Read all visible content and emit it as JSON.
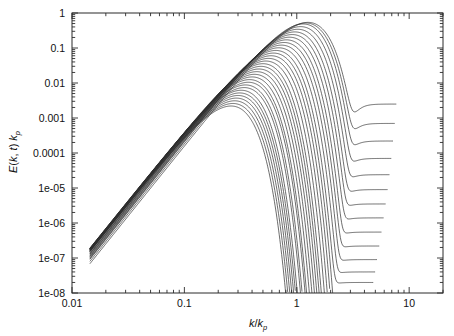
{
  "figure": {
    "background_color": "#ffffff",
    "frame_color": "#2b2b2b",
    "line_color": "#2e2e2e"
  },
  "axes": {
    "x": {
      "label_main": "k",
      "label_slash": "/",
      "label_den": "k",
      "label_den_sub": "p",
      "label_full": "k/k_p",
      "scale": "log",
      "min": 0.01,
      "max": 20,
      "tick_labels": [
        "0.01",
        "0.1",
        "1",
        "10"
      ],
      "tick_values": [
        0.01,
        0.1,
        1,
        10
      ]
    },
    "y": {
      "label_fn": "E",
      "label_args": "(k, t)",
      "label_factor": "k",
      "label_factor_sub": "p",
      "label_full": "E(k, t) k_p",
      "scale": "log",
      "min": 1e-08,
      "max": 1,
      "tick_labels": [
        "1",
        "0.1",
        "0.01",
        "0.001",
        "0.0001",
        "1e-05",
        "1e-06",
        "1e-07",
        "1e-08"
      ],
      "tick_values": [
        1,
        0.1,
        0.01,
        0.001,
        0.0001,
        1e-05,
        1e-06,
        1e-07,
        1e-08
      ]
    }
  },
  "chart_data": {
    "type": "line",
    "title": "",
    "xlabel": "k/k_p",
    "ylabel": "E(k, t) k_p",
    "xscale": "log",
    "yscale": "log",
    "xlim": [
      0.01,
      20
    ],
    "ylim": [
      1e-08,
      1
    ],
    "grid": false,
    "legend": "none",
    "n_curves": 34,
    "low_k_slope": 4,
    "series": [
      {
        "name": "t01",
        "peak_x": 0.26,
        "peak_y": 0.0022,
        "cutoff_x": 2.1,
        "tail_floor": null
      },
      {
        "name": "t02",
        "peak_x": 0.27,
        "peak_y": 0.0026,
        "cutoff_x": 2.2,
        "tail_floor": null
      },
      {
        "name": "t03",
        "peak_x": 0.28,
        "peak_y": 0.0031,
        "cutoff_x": 2.25,
        "tail_floor": null
      },
      {
        "name": "t04",
        "peak_x": 0.29,
        "peak_y": 0.0037,
        "cutoff_x": 2.3,
        "tail_floor": null
      },
      {
        "name": "t05",
        "peak_x": 0.3,
        "peak_y": 0.0044,
        "cutoff_x": 2.35,
        "tail_floor": null
      },
      {
        "name": "t06",
        "peak_x": 0.31,
        "peak_y": 0.0052,
        "cutoff_x": 2.4,
        "tail_floor": null
      },
      {
        "name": "t07",
        "peak_x": 0.32,
        "peak_y": 0.0062,
        "cutoff_x": 2.45,
        "tail_floor": null
      },
      {
        "name": "t08",
        "peak_x": 0.34,
        "peak_y": 0.0074,
        "cutoff_x": 2.5,
        "tail_floor": null
      },
      {
        "name": "t09",
        "peak_x": 0.35,
        "peak_y": 0.0088,
        "cutoff_x": 2.55,
        "tail_floor": null
      },
      {
        "name": "t10",
        "peak_x": 0.37,
        "peak_y": 0.0105,
        "cutoff_x": 2.6,
        "tail_floor": null
      },
      {
        "name": "t11",
        "peak_x": 0.38,
        "peak_y": 0.0125,
        "cutoff_x": 2.65,
        "tail_floor": null
      },
      {
        "name": "t12",
        "peak_x": 0.4,
        "peak_y": 0.0149,
        "cutoff_x": 2.72,
        "tail_floor": null
      },
      {
        "name": "t13",
        "peak_x": 0.42,
        "peak_y": 0.0177,
        "cutoff_x": 2.8,
        "tail_floor": null
      },
      {
        "name": "t14",
        "peak_x": 0.44,
        "peak_y": 0.0211,
        "cutoff_x": 2.88,
        "tail_floor": null
      },
      {
        "name": "t15",
        "peak_x": 0.46,
        "peak_y": 0.0251,
        "cutoff_x": 2.96,
        "tail_floor": null
      },
      {
        "name": "t16",
        "peak_x": 0.48,
        "peak_y": 0.0299,
        "cutoff_x": 3.05,
        "tail_floor": null
      },
      {
        "name": "t17",
        "peak_x": 0.5,
        "peak_y": 0.0356,
        "cutoff_x": 3.15,
        "tail_floor": null
      },
      {
        "name": "t18",
        "peak_x": 0.53,
        "peak_y": 0.0424,
        "cutoff_x": 3.25,
        "tail_floor": null
      },
      {
        "name": "t19",
        "peak_x": 0.56,
        "peak_y": 0.0505,
        "cutoff_x": 3.35,
        "tail_floor": null
      },
      {
        "name": "t20",
        "peak_x": 0.59,
        "peak_y": 0.0601,
        "cutoff_x": 3.5,
        "tail_floor": null
      },
      {
        "name": "t21",
        "peak_x": 0.62,
        "peak_y": 0.0716,
        "cutoff_x": 3.65,
        "tail_floor": null
      },
      {
        "name": "t22",
        "peak_x": 0.65,
        "peak_y": 0.0852,
        "cutoff_x": 3.8,
        "tail_floor": 2e-08
      },
      {
        "name": "t23",
        "peak_x": 0.69,
        "peak_y": 0.1014,
        "cutoff_x": 3.95,
        "tail_floor": 4e-08
      },
      {
        "name": "t24",
        "peak_x": 0.73,
        "peak_y": 0.1207,
        "cutoff_x": 4.1,
        "tail_floor": 9e-08
      },
      {
        "name": "t25",
        "peak_x": 0.77,
        "peak_y": 0.1437,
        "cutoff_x": 4.3,
        "tail_floor": 2.2e-07
      },
      {
        "name": "t26",
        "peak_x": 0.81,
        "peak_y": 0.171,
        "cutoff_x": 4.5,
        "tail_floor": 5.5e-07
      },
      {
        "name": "t27",
        "peak_x": 0.86,
        "peak_y": 0.2035,
        "cutoff_x": 4.7,
        "tail_floor": 1.4e-06
      },
      {
        "name": "t28",
        "peak_x": 0.91,
        "peak_y": 0.2422,
        "cutoff_x": 4.9,
        "tail_floor": 3.5e-06
      },
      {
        "name": "t29",
        "peak_x": 0.96,
        "peak_y": 0.2882,
        "cutoff_x": 5.1,
        "tail_floor": 9e-06
      },
      {
        "name": "t30",
        "peak_x": 1.02,
        "peak_y": 0.343,
        "cutoff_x": 5.3,
        "tail_floor": 2.4e-05
      },
      {
        "name": "t31",
        "peak_x": 1.08,
        "peak_y": 0.4081,
        "cutoff_x": 5.5,
        "tail_floor": 7e-05
      },
      {
        "name": "t32",
        "peak_x": 1.14,
        "peak_y": 0.4857,
        "cutoff_x": 5.7,
        "tail_floor": 0.00022
      },
      {
        "name": "t33",
        "peak_x": 1.2,
        "peak_y": 0.52,
        "cutoff_x": 5.9,
        "tail_floor": 0.0007
      },
      {
        "name": "t34",
        "peak_x": 1.26,
        "peak_y": 0.54,
        "cutoff_x": 6.1,
        "tail_floor": 0.0025
      }
    ]
  }
}
